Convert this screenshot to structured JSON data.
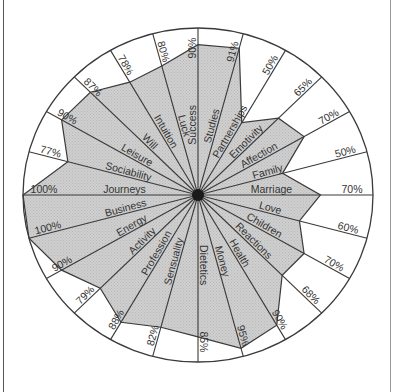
{
  "chart_data": {
    "type": "radar",
    "title": "",
    "unit": "%",
    "max": 100,
    "categories": [
      "Success",
      "Studies",
      "Partnerships",
      "Emotivity",
      "Affection",
      "Family",
      "Marriage",
      "Love",
      "Children",
      "Reactions",
      "Health",
      "Money",
      "Dietetics",
      "Sensuality",
      "Profession",
      "Activity",
      "Energy",
      "Business",
      "Journeys",
      "Sociability",
      "Leisure",
      "Will",
      "Intuition",
      "Luck"
    ],
    "values": [
      90,
      91,
      50,
      65,
      70,
      50,
      70,
      60,
      70,
      68,
      90,
      95,
      85,
      82,
      88,
      79,
      90,
      100,
      100,
      77,
      90,
      87,
      78,
      80
    ],
    "value_labels": [
      "90%",
      "91%",
      "50%",
      "65%",
      "70%",
      "50%",
      "70%",
      "60%",
      "70%",
      "68%",
      "90%",
      "95%",
      "85%",
      "82%",
      "88%",
      "79%",
      "90%",
      "100%",
      "100%",
      "77%",
      "90%",
      "87%",
      "78%",
      "80%"
    ],
    "start_angle_deg": 90,
    "direction": "clockwise",
    "grid": false,
    "legend": "none"
  },
  "style": {
    "fill_color": "#c8c8c8",
    "line_color": "#3a3a3a",
    "center_dot_color": "#1a1a1a",
    "background": "#ffffff"
  }
}
